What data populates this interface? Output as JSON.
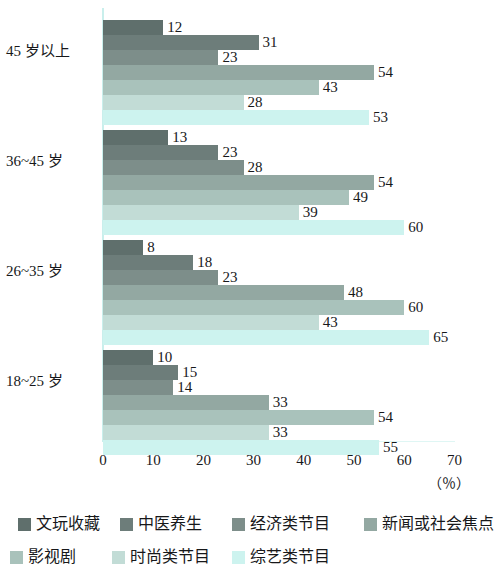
{
  "chart_data": {
    "type": "bar",
    "orientation": "horizontal",
    "title": "",
    "subtitle": "",
    "xlabel": "（％）",
    "ylabel": "",
    "xlim": [
      0,
      70
    ],
    "xticks": [
      "0",
      "10",
      "20",
      "30",
      "40",
      "50",
      "60",
      "70"
    ],
    "grid": false,
    "legend_position": "bottom",
    "categories": [
      "45 岁以上",
      "36~45 岁",
      "26~35 岁",
      "18~25 岁"
    ],
    "series": [
      {
        "name": "文玩收藏",
        "color": "#5f6f6c",
        "values": [
          12,
          13,
          8,
          10
        ]
      },
      {
        "name": "中医养生",
        "color": "#6d7d7a",
        "values": [
          31,
          23,
          18,
          15
        ]
      },
      {
        "name": "经济类节目",
        "color": "#7d8e8a",
        "values": [
          23,
          28,
          23,
          14
        ]
      },
      {
        "name": "新闻或社会焦点",
        "color": "#93a8a2",
        "values": [
          54,
          54,
          48,
          33
        ]
      },
      {
        "name": "影视剧",
        "color": "#a9c2bb",
        "values": [
          43,
          49,
          60,
          54
        ]
      },
      {
        "name": "时尚类节目",
        "color": "#c2dcd6",
        "values": [
          28,
          39,
          43,
          33
        ]
      },
      {
        "name": "综艺类节目",
        "color": "#cdf3ef",
        "values": [
          53,
          60,
          65,
          55
        ]
      }
    ]
  },
  "axis": {
    "unit": "（％）"
  }
}
